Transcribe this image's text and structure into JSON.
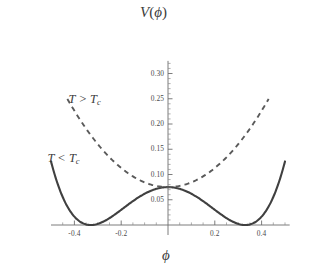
{
  "chart_data": {
    "type": "line",
    "title": "",
    "xlabel": "ϕ",
    "ylabel": "V(ϕ)",
    "xlim": [
      -0.5,
      0.52
    ],
    "ylim": [
      0.0,
      0.325
    ],
    "grid": false,
    "legend_position": "inline-annotations",
    "x_ticks": [
      -0.4,
      -0.2,
      0.2,
      0.4
    ],
    "x_tick_labels": [
      "-0.4",
      "-0.2",
      "0.2",
      "0.4"
    ],
    "x_minor_ticks": [
      -0.45,
      -0.35,
      -0.3,
      -0.25,
      -0.15,
      -0.1,
      -0.05,
      0.05,
      0.1,
      0.15,
      0.25,
      0.3,
      0.35,
      0.45,
      0.5
    ],
    "y_ticks": [
      0.05,
      0.1,
      0.15,
      0.2,
      0.25,
      0.3
    ],
    "y_tick_labels": [
      "0.05",
      "0.10",
      "0.15",
      "0.20",
      "0.25",
      "0.30"
    ],
    "y_minor_ticks": [
      0.01,
      0.02,
      0.03,
      0.04,
      0.06,
      0.07,
      0.08,
      0.09,
      0.11,
      0.12,
      0.13,
      0.14,
      0.16,
      0.17,
      0.18,
      0.19,
      0.21,
      0.22,
      0.23,
      0.24,
      0.26,
      0.27,
      0.28,
      0.29,
      0.31,
      0.32
    ],
    "series": [
      {
        "name": "T < Tc",
        "style": "solid",
        "color": "#404040",
        "annotation": "T < T_c",
        "description": "double-well symmetry-broken potential with minima near phi = -0.33 and phi = +0.33 at V = 0, local maximum at phi = 0 with V = 0.075",
        "minima_x": [
          -0.33,
          0.33
        ],
        "minima_y": [
          0.0,
          0.0
        ],
        "center_value": 0.075,
        "x": [
          -0.5,
          -0.48,
          -0.46,
          -0.44,
          -0.42,
          -0.4,
          -0.38,
          -0.36,
          -0.34,
          -0.32,
          -0.3,
          -0.28,
          -0.26,
          -0.24,
          -0.22,
          -0.2,
          -0.18,
          -0.16,
          -0.14,
          -0.12,
          -0.1,
          -0.08,
          -0.06,
          -0.04,
          -0.02,
          0,
          0.02,
          0.04,
          0.06,
          0.08,
          0.1,
          0.12,
          0.14,
          0.16,
          0.18,
          0.2,
          0.22,
          0.24,
          0.26,
          0.28,
          0.3,
          0.32,
          0.34,
          0.36,
          0.38,
          0.4,
          0.42,
          0.44,
          0.46,
          0.48,
          0.5
        ],
        "y": [
          0.2497,
          0.2134,
          0.1805,
          0.1509,
          0.1244,
          0.1008,
          0.0801,
          0.0621,
          0.0467,
          0.0338,
          0.0233,
          0.015,
          0.0088,
          0.0045,
          0.0019,
          0.0007,
          0.0007,
          0.0016,
          0.0031,
          0.0049,
          0.0068,
          0.0084,
          0.0097,
          0.0104,
          0.0107,
          0.0107,
          0.0107,
          0.0104,
          0.0097,
          0.0084,
          0.0068,
          0.0049,
          0.0031,
          0.0016,
          0.0007,
          0.0007,
          0.0019,
          0.0045,
          0.0088,
          0.015,
          0.0233,
          0.0338,
          0.0467,
          0.0621,
          0.0801,
          0.1008,
          0.1244,
          0.1509,
          0.1805,
          0.2134,
          0.2497
        ]
      },
      {
        "name": "T > Tc",
        "style": "dashed",
        "color": "#5a5a5a",
        "annotation": "T > T_c",
        "description": "single-well parabolic potential with minimum at phi = 0, V = 0.075",
        "minima_x": [
          0.0
        ],
        "minima_y": [
          0.075
        ],
        "center_value": 0.075,
        "x_range": [
          -0.43,
          0.43
        ],
        "x": [
          -0.43,
          -0.41,
          -0.39,
          -0.37,
          -0.35,
          -0.33,
          -0.31,
          -0.29,
          -0.27,
          -0.25,
          -0.23,
          -0.21,
          -0.19,
          -0.17,
          -0.15,
          -0.13,
          -0.11,
          -0.09,
          -0.07,
          -0.05,
          -0.03,
          -0.01,
          0.01,
          0.03,
          0.05,
          0.07,
          0.09,
          0.11,
          0.13,
          0.15,
          0.17,
          0.19,
          0.21,
          0.23,
          0.25,
          0.27,
          0.29,
          0.31,
          0.33,
          0.35,
          0.37,
          0.39,
          0.41,
          0.43
        ],
        "y": [
          0.2497,
          0.2285,
          0.2083,
          0.1891,
          0.1709,
          0.1537,
          0.1375,
          0.1223,
          0.1081,
          0.0949,
          0.0827,
          0.0715,
          0.0613,
          0.0521,
          0.0439,
          0.0367,
          0.0305,
          0.0253,
          0.0211,
          0.0179,
          0.0157,
          0.0145,
          0.0145,
          0.0157,
          0.0179,
          0.0211,
          0.0253,
          0.0305,
          0.0367,
          0.0439,
          0.0521,
          0.0613,
          0.0715,
          0.0827,
          0.0949,
          0.1081,
          0.1223,
          0.1375,
          0.1537,
          0.1709,
          0.1891,
          0.2083,
          0.2285,
          0.2497
        ]
      }
    ],
    "annotations": [
      {
        "id": "hot-label",
        "text_main": "T > T",
        "text_sub": "c",
        "x": 0.075,
        "y": 0.248
      },
      {
        "id": "cold-label",
        "text_main": "T < T",
        "text_sub": "c",
        "x": 0.065,
        "y": 0.13
      }
    ]
  },
  "labels": {
    "y_axis_title_v": "V",
    "y_axis_title_open": "(",
    "y_axis_title_phi": "ϕ",
    "y_axis_title_close": ")",
    "x_axis_title": "ϕ",
    "hot_main": "T > T",
    "hot_sub": "c",
    "cold_main": "T < T",
    "cold_sub": "c"
  },
  "colors": {
    "background": "#ffffff",
    "axis": "#6e6e6e",
    "solid_curve": "#404040",
    "dashed_curve": "#5a5a5a",
    "text": "#3c3c3c"
  }
}
